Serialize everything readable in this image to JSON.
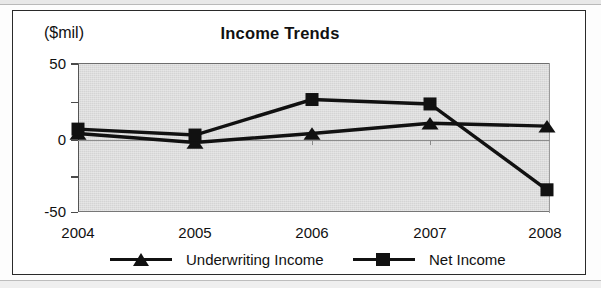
{
  "chart_data": {
    "type": "line",
    "title": "Income Trends",
    "ylabel": "($mil)",
    "xlabel": "",
    "categories": [
      "2004",
      "2005",
      "2006",
      "2007",
      "2008"
    ],
    "ylim": [
      -50,
      50
    ],
    "ytick_labels": [
      "50",
      "0",
      "-50"
    ],
    "ytick_values": [
      50,
      0,
      -50
    ],
    "yminor_ticks": [
      25,
      -25
    ],
    "grid": false,
    "zero_line": true,
    "legend_position": "bottom",
    "plot_background": "#d4d4d4",
    "series": [
      {
        "name": "Underwriting Income",
        "marker": "triangle",
        "color": "#111111",
        "values": [
          3,
          -3,
          3,
          10,
          8
        ]
      },
      {
        "name": "Net Income",
        "marker": "square",
        "color": "#111111",
        "values": [
          6,
          2,
          26,
          23,
          -35
        ]
      }
    ]
  },
  "legend": {
    "items": [
      {
        "label": "Underwriting Income",
        "marker": "triangle"
      },
      {
        "label": "Net Income",
        "marker": "square"
      }
    ]
  }
}
